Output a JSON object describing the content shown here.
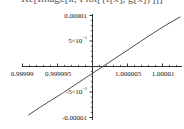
{
  "title": {
    "text": "Re[Image[k, Plot[{f[x], g[x]}]]]",
    "clipped": true
  },
  "chart_data": {
    "type": "line",
    "title": "Re[Image[k, Plot[{f[x], g[x]}]]]",
    "xlabel": "",
    "ylabel": "",
    "xlim": [
      0.9999875,
      1.0000125
    ],
    "ylim": [
      -1.25e-05,
      1.25e-05
    ],
    "grid": false,
    "legend": null,
    "xticks": [
      0.99999,
      0.999995,
      1.000005,
      1.00001
    ],
    "xticklabels": [
      "0.99999",
      "0.999995",
      "1.000005",
      "1.00001"
    ],
    "yticks": [
      1e-05,
      5e-06,
      -5e-06,
      -1e-05
    ],
    "yticklabels": [
      "0.00001",
      "5×10⁻⁶",
      "-5×10⁻⁶",
      "-0.00001"
    ],
    "series": [
      {
        "name": "curve",
        "color": "#4d4d4d",
        "x": [
          0.99998855,
          0.99999,
          0.999992,
          0.999994,
          0.999996,
          0.999998,
          1.0,
          1.000002,
          1.000004,
          1.000006,
          1.000008,
          1.00001,
          1.0000122
        ],
        "y": [
          -1.13e-05,
          -9.8e-06,
          -7.9e-06,
          -6e-06,
          -4e-06,
          -2e-06,
          0.0,
          2e-06,
          4e-06,
          6e-06,
          8e-06,
          9.9e-06,
          1.18e-05
        ]
      }
    ]
  },
  "axes": {
    "origin_label": "",
    "x_axis_name": "horizontal-axis",
    "y_axis_name": "vertical-axis"
  }
}
